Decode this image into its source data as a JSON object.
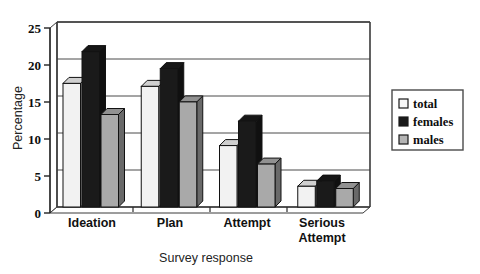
{
  "chart_data": {
    "type": "bar",
    "title": "",
    "subtitle": "",
    "xlabel": "Survey response",
    "ylabel": "Percentage",
    "categories": [
      "Ideation",
      "Plan",
      "Attempt",
      "Serious Attempt"
    ],
    "series": [
      {
        "name": "total",
        "color": "#f2f2f2",
        "values": [
          16.7,
          16.3,
          8.3,
          2.8
        ]
      },
      {
        "name": "females",
        "color": "#1a1a1a",
        "values": [
          21.0,
          18.7,
          11.6,
          3.5
        ]
      },
      {
        "name": "males",
        "color": "#a9a9a9",
        "values": [
          12.5,
          14.2,
          5.8,
          2.5
        ]
      }
    ],
    "ylim": [
      0,
      25
    ],
    "yticks": [
      0,
      5,
      10,
      15,
      20,
      25
    ],
    "ytick_labels": [
      "0",
      "5",
      "10",
      "15",
      "20",
      "25"
    ],
    "grid": true,
    "grid_axis": "y",
    "legend_position": "right",
    "style": "3d-bars",
    "plot_background": "#ffffff",
    "axis_color": "#3a3a3a",
    "grid_color": "#4a4a4a"
  },
  "legend": {
    "entries": [
      {
        "label": "total",
        "swatch": "#f7f7f7"
      },
      {
        "label": "females",
        "swatch": "#1a1a1a"
      },
      {
        "label": "males",
        "swatch": "#b5b5b5"
      }
    ]
  },
  "axes": {
    "y_title": "Percentage",
    "x_title": "Survey response",
    "y_tick_0": "0",
    "y_tick_1": "5",
    "y_tick_2": "10",
    "y_tick_3": "15",
    "y_tick_4": "20",
    "y_tick_5": "25"
  },
  "categories_text": {
    "c0": "Ideation",
    "c1": "Plan",
    "c2": "Attempt",
    "c3_line1": "Serious",
    "c3_line2": "Attempt"
  }
}
